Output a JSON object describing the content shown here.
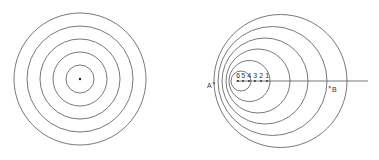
{
  "left_figure": {
    "center": [
      80,
      79
    ],
    "radii": [
      14,
      27,
      40,
      53,
      66
    ],
    "center_dot": true
  },
  "right_figure": {
    "axis_y": 81,
    "axis_x_end": 368,
    "circles": [
      {
        "cx": 280.5,
        "r": 66.5
      },
      {
        "cx": 272.5,
        "r": 54.5
      },
      {
        "cx": 265,
        "r": 43
      },
      {
        "cx": 258,
        "r": 32
      },
      {
        "cx": 249.5,
        "r": 20.5
      },
      {
        "cx": 241,
        "r": 10
      }
    ],
    "source_points": [
      {
        "label": "6",
        "x": 238
      },
      {
        "label": "5",
        "x": 243
      },
      {
        "label": "4",
        "x": 249
      },
      {
        "label": "3",
        "x": 255
      },
      {
        "label": "2",
        "x": 261
      },
      {
        "label": "1",
        "x": 267
      }
    ],
    "observer_a": {
      "label": "A",
      "marker": "×",
      "x": 207,
      "y": 86
    },
    "observer_b": {
      "label": "B",
      "marker": "×",
      "x": 332,
      "y": 91
    }
  },
  "stroke_color": "#555555"
}
